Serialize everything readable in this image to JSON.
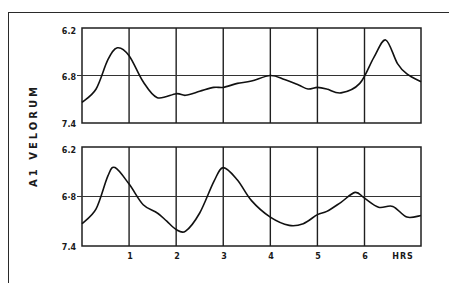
{
  "chart_data": [
    {
      "type": "line",
      "title": "",
      "xlabel": "HRS",
      "ylabel": "A1 VELORUM",
      "y_ticks": [
        "6.2",
        "6.8",
        "7.4"
      ],
      "ylim": [
        7.4,
        6.2
      ],
      "y_inverted": true,
      "xlim": [
        0,
        7.2
      ],
      "x_ticks": [],
      "grid": {
        "vertical": [
          1,
          2,
          3,
          4,
          5,
          6
        ],
        "horizontal": [
          6.8
        ]
      },
      "series": [
        {
          "name": "upper light curve",
          "x": [
            0,
            0.3,
            0.55,
            0.75,
            1.0,
            1.3,
            1.6,
            2.0,
            2.2,
            2.5,
            2.8,
            3.0,
            3.3,
            3.6,
            4.0,
            4.3,
            4.6,
            4.8,
            5.0,
            5.2,
            5.5,
            5.9,
            6.2,
            6.45,
            6.7,
            6.9,
            7.2
          ],
          "y": [
            7.14,
            6.97,
            6.6,
            6.45,
            6.55,
            6.88,
            7.08,
            7.03,
            7.05,
            7.0,
            6.95,
            6.95,
            6.9,
            6.87,
            6.8,
            6.85,
            6.92,
            6.97,
            6.95,
            6.97,
            7.02,
            6.9,
            6.57,
            6.35,
            6.65,
            6.78,
            6.88
          ]
        }
      ]
    },
    {
      "type": "line",
      "title": "",
      "xlabel": "HRS",
      "ylabel": "A1 VELORUM",
      "y_ticks": [
        "6.2",
        "6.8",
        "7.4"
      ],
      "ylim": [
        7.4,
        6.2
      ],
      "y_inverted": true,
      "xlim": [
        0,
        7.2
      ],
      "x_ticks": [
        "1",
        "2",
        "3",
        "4",
        "5",
        "6",
        "HRS"
      ],
      "grid": {
        "vertical": [
          1,
          2,
          3,
          4,
          5,
          6
        ],
        "horizontal": [
          6.8
        ]
      },
      "series": [
        {
          "name": "lower light curve",
          "x": [
            0,
            0.3,
            0.55,
            0.7,
            1.0,
            1.3,
            1.6,
            1.8,
            2.0,
            2.2,
            2.5,
            2.8,
            3.0,
            3.3,
            3.6,
            4.0,
            4.4,
            4.7,
            5.0,
            5.2,
            5.5,
            5.8,
            6.0,
            6.3,
            6.6,
            6.9,
            7.2
          ],
          "y": [
            7.13,
            6.95,
            6.55,
            6.45,
            6.65,
            6.9,
            7.0,
            7.1,
            7.2,
            7.22,
            7.0,
            6.62,
            6.45,
            6.6,
            6.85,
            7.05,
            7.15,
            7.13,
            7.02,
            6.98,
            6.87,
            6.75,
            6.82,
            6.93,
            6.92,
            7.05,
            7.03
          ]
        }
      ]
    }
  ],
  "axis": {
    "ylabel": "A1  VELORUM",
    "top_y_ticks": [
      "6.2",
      "6.8",
      "7.4"
    ],
    "bottom_y_ticks": [
      "6.2",
      "6·8",
      "7.4"
    ],
    "x_ticks": [
      "1",
      "2",
      "3",
      "4",
      "5",
      "6"
    ],
    "x_unit": "HRS"
  }
}
